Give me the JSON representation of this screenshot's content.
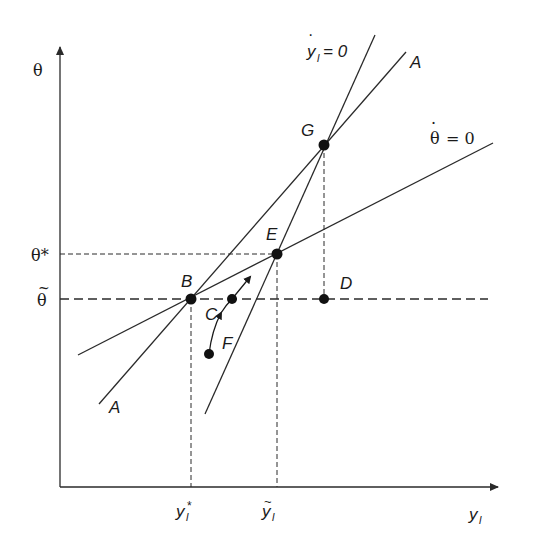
{
  "diagram": {
    "axes": {
      "y_axis_label": "θ",
      "x_axis_label": "y",
      "x_axis_label_sub": "l"
    },
    "tick_labels": {
      "theta_star": "θ*",
      "theta_tilde": "θ",
      "theta_tilde_accent": "~",
      "y_star": "y",
      "y_star_sub": "l",
      "y_star_sup": "*",
      "y_tilde": "y",
      "y_tilde_sub": "l",
      "y_tilde_accent": "~"
    },
    "curves": {
      "y_dot_zero": {
        "label": "y",
        "sub": "l",
        "suffix": "= 0",
        "dot": "·"
      },
      "theta_dot_zero": {
        "label": "θ",
        "suffix": "= 0",
        "dot": "·"
      },
      "A_line": {
        "label_top": "A",
        "label_bottom": "A"
      }
    },
    "points": {
      "B": "B",
      "C": "C",
      "D": "D",
      "E": "E",
      "F": "F",
      "G": "G"
    },
    "colors": {
      "line": "#2a2a2a",
      "background": "#ffffff"
    }
  }
}
